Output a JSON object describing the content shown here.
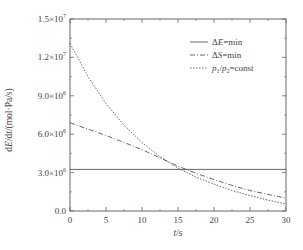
{
  "chart_data": {
    "type": "line",
    "title": "",
    "xlabel": "t/s",
    "ylabel": "dE/dt/(mol·Pa/s)",
    "xlim": [
      0,
      30
    ],
    "ylim": [
      0,
      15000000
    ],
    "xticks": [
      0,
      5,
      10,
      15,
      20,
      25,
      30
    ],
    "xtick_labels": [
      "0",
      "5",
      "10",
      "15",
      "20",
      "25",
      "30"
    ],
    "yticks": [
      0,
      3000000,
      6000000,
      9000000,
      12000000,
      15000000
    ],
    "ytick_labels": [
      {
        "mant": "0.0",
        "exp": ""
      },
      {
        "mant": "3.0×10",
        "exp": "6"
      },
      {
        "mant": "6.0×10",
        "exp": "6"
      },
      {
        "mant": "9.0×10",
        "exp": "6"
      },
      {
        "mant": "1.2×10",
        "exp": "7"
      },
      {
        "mant": "1.5×10",
        "exp": "7"
      }
    ],
    "grid": false,
    "legend_position": "upper right",
    "x": [
      0,
      2.5,
      5,
      7.5,
      10,
      12.5,
      15,
      17.5,
      20,
      22.5,
      25,
      27.5,
      30
    ],
    "series": [
      {
        "name": "ΔE=min",
        "style": "solid",
        "values": [
          3250000,
          3250000,
          3250000,
          3250000,
          3250000,
          3250000,
          3250000,
          3250000,
          3250000,
          3250000,
          3250000,
          3250000,
          3250000
        ]
      },
      {
        "name": "ΔS=min",
        "style": "dashdot",
        "values": [
          6900000,
          6400000,
          5900000,
          5350000,
          4800000,
          4150000,
          3500000,
          2950000,
          2450000,
          2000000,
          1600000,
          1300000,
          1000000
        ]
      },
      {
        "name": "p1/p2=const",
        "style": "dotted",
        "values": [
          13100000,
          10500000,
          8400000,
          6700000,
          5350000,
          4250000,
          3350000,
          2650000,
          2100000,
          1600000,
          1200000,
          850000,
          550000
        ]
      }
    ]
  },
  "legend": {
    "items": [
      {
        "prefix": "Δ",
        "italic": "E",
        "suffix": "=min"
      },
      {
        "prefix": "Δ",
        "italic": "S",
        "suffix": "=min"
      },
      {
        "prefix": "",
        "italic": "p",
        "sub1": "1",
        "slash": "/",
        "italic2": "p",
        "sub2": "2",
        "suffix": "=const"
      }
    ]
  },
  "axis_text": {
    "x_italic": "t",
    "x_rest": "/s",
    "y_pre": "d",
    "y_E": "E",
    "y_mid": "/d",
    "y_t": "t",
    "y_rest": "/(mol·Pa/s)"
  },
  "colors": {
    "line": "#555555",
    "axis": "#666666",
    "text": "#444444"
  }
}
